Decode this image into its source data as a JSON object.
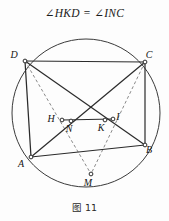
{
  "figure": {
    "title": "∠HKD = ∠INC",
    "caption": "图 11",
    "title_parts": {
      "left_angle_symbol": "∠",
      "left_points": "HKD",
      "equals": "=",
      "right_angle_symbol": "∠",
      "right_points": "INC"
    }
  },
  "geometry": {
    "stroke_color": "#2b2b2b",
    "dashed_color": "#8a8a8a",
    "circle_color": "#3a3a3a",
    "point_fill": "#ffffff",
    "circle": {
      "cx": 86,
      "cy": 87,
      "r": 74
    },
    "points": [
      {
        "id": "D",
        "label": "D",
        "x": 25,
        "y": 35,
        "label_dx": -11,
        "label_dy": -3
      },
      {
        "id": "C",
        "label": "C",
        "x": 145,
        "y": 36,
        "label_dx": 4,
        "label_dy": -4
      },
      {
        "id": "A",
        "label": "A",
        "x": 31,
        "y": 131,
        "label_dx": -10,
        "label_dy": 10
      },
      {
        "id": "B",
        "label": "B",
        "x": 145,
        "y": 119,
        "label_dx": 4,
        "label_dy": 8
      },
      {
        "id": "M",
        "label": "M",
        "x": 91,
        "y": 148,
        "label_dx": -3,
        "label_dy": 12
      },
      {
        "id": "H",
        "label": "H",
        "x": 62,
        "y": 94,
        "label_dx": -11,
        "label_dy": 2
      },
      {
        "id": "N",
        "label": "N",
        "x": 71,
        "y": 95,
        "label_dx": -2,
        "label_dy": 11
      },
      {
        "id": "K",
        "label": "K",
        "x": 105,
        "y": 94,
        "label_dx": -4,
        "label_dy": 11
      },
      {
        "id": "I",
        "label": "I",
        "x": 113,
        "y": 93,
        "label_dx": 5,
        "label_dy": 1
      }
    ],
    "solid_segments": [
      {
        "name": "DC",
        "from": "D",
        "to": "C"
      },
      {
        "name": "DA",
        "from": "D",
        "to": "A"
      },
      {
        "name": "AB",
        "from": "A",
        "to": "B"
      },
      {
        "name": "CB",
        "from": "C",
        "to": "B"
      },
      {
        "name": "AC",
        "from": "A",
        "to": "C"
      },
      {
        "name": "DB",
        "from": "D",
        "to": "B"
      },
      {
        "name": "HI",
        "from": "H",
        "to": "I"
      }
    ],
    "dashed_segments": [
      {
        "name": "DM",
        "from": "D",
        "to": "M"
      },
      {
        "name": "CM",
        "from": "C",
        "to": "M"
      }
    ]
  }
}
